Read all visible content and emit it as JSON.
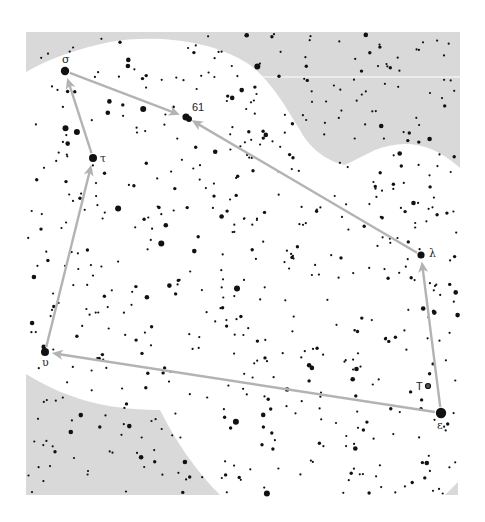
{
  "chart": {
    "kind": "star-chart",
    "colors": {
      "background": "#ffffff",
      "shaded_region": "#d9d9d9",
      "star": "#111111",
      "connector": "#b3b3b3"
    },
    "frame": {
      "x": 26,
      "y": 32,
      "width": 193,
      "height": 143
    }
  },
  "stars_named": [
    {
      "id": "sigma",
      "label": "σ",
      "x": 65,
      "y": 71,
      "r": 4.2,
      "label_dx": -3,
      "label_dy": -8
    },
    {
      "id": "61",
      "label": "61",
      "x": 186,
      "y": 117,
      "r": 3.6,
      "label_dx": 6,
      "label_dy": -6
    },
    {
      "id": "tau",
      "label": "τ",
      "x": 93,
      "y": 158,
      "r": 4.0,
      "label_dx": 7,
      "label_dy": 4
    },
    {
      "id": "lambda",
      "label": "λ",
      "x": 421,
      "y": 255,
      "r": 3.6,
      "label_dx": 8,
      "label_dy": 2
    },
    {
      "id": "upsilon",
      "label": "υ",
      "x": 45,
      "y": 352,
      "r": 4.0,
      "label_dx": -3,
      "label_dy": 14
    },
    {
      "id": "T",
      "label": "T",
      "x": 428,
      "y": 386,
      "r": 2.5,
      "label_dx": -12,
      "label_dy": 4
    },
    {
      "id": "epsilon",
      "label": "ε",
      "x": 441,
      "y": 413,
      "r": 5.2,
      "label_dx": -4,
      "label_dy": 16
    }
  ],
  "connectors": [
    {
      "from": "sigma",
      "to": "61"
    },
    {
      "from": "lambda",
      "to": "61"
    },
    {
      "from": "tau",
      "to": "sigma"
    },
    {
      "from": "upsilon",
      "to": "tau"
    },
    {
      "from": "epsilon",
      "to": "upsilon"
    },
    {
      "from": "epsilon",
      "to": "lambda"
    }
  ]
}
